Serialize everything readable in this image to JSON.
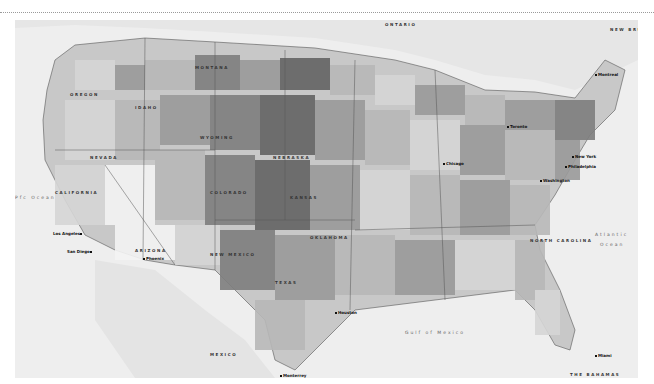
{
  "map": {
    "title": "United States county choropleth map",
    "style": "grayscale",
    "colors": {
      "background": "#ffffff",
      "water": "#eeeeee",
      "land_outside": "#e4e4e4",
      "county_shades": [
        "#f4f4f4",
        "#d6d6d6",
        "#b8b8b8",
        "#9a9a9a",
        "#7e7e7e",
        "#646464"
      ],
      "border": "#555555"
    },
    "water_labels": {
      "pacific": "Pfc Ocean",
      "atlantic_line1": "Atlantic",
      "atlantic_line2": "Ocean",
      "gulf": "Gulf of Mexico"
    },
    "country_labels": {
      "mexico": "MEXICO",
      "ontario": "ONTARIO",
      "new_brunswick": "NEW BRUNSWICK",
      "bahamas": "THE BAHAMAS"
    },
    "state_labels": {
      "california": "CALIFORNIA",
      "arizona": "ARIZONA",
      "new_mexico": "NEW MEXICO",
      "nevada": "NEVADA",
      "oregon": "OREGON",
      "idaho": "IDAHO",
      "montana": "MONTANA",
      "wyoming": "WYOMING",
      "colorado": "COLORADO",
      "nebraska": "NEBRASKA",
      "kansas": "KANSAS",
      "oklahoma": "OKLAHOMA",
      "texas": "TEXAS",
      "north_carolina": "NORTH CAROLINA"
    },
    "city_labels": {
      "los_angeles": "Los Angeles",
      "san_diego": "San Diego",
      "phoenix": "Phoenix",
      "monterrey": "Monterrey",
      "houston": "Houston",
      "chicago": "Chicago",
      "toronto": "Toronto",
      "new_york": "New York",
      "philadelphia": "Philadelphia",
      "washington": "Washington",
      "montreal": "Montreal",
      "miami": "Miami"
    }
  }
}
